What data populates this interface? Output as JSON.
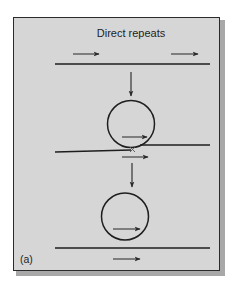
{
  "figure": {
    "title": "Direct repeats",
    "panel_label": "(a)",
    "colors": {
      "panel_background": "#d6d6d6",
      "panel_border": "#2a2a2a",
      "panel_shadow": "#a8a8a8",
      "line": "#1e1e1e",
      "arrow": "#2a2a2a",
      "page_background": "#ffffff"
    }
  },
  "stages": [
    {
      "id": "stage-1",
      "description": "Linear DNA with two direct repeats",
      "elements": [
        "dna-line",
        "repeat-arrow-left",
        "repeat-arrow-right"
      ]
    },
    {
      "id": "stage-2",
      "description": "Looped DNA with repeats aligned; crossover point",
      "elements": [
        "dna-loop",
        "repeat-arrow-in-loop",
        "crossover-mark",
        "repeat-arrow-below-crossover"
      ]
    },
    {
      "id": "stage-3",
      "description": "Excised circle with one repeat and remaining linear DNA with one repeat",
      "elements": [
        "excised-circle",
        "repeat-arrow-in-circle",
        "remaining-dna-line",
        "repeat-arrow-on-line"
      ]
    }
  ],
  "flow_arrows": [
    {
      "from": "stage-1",
      "to": "stage-2",
      "direction": "down"
    },
    {
      "from": "stage-2",
      "to": "stage-3",
      "direction": "down"
    }
  ]
}
